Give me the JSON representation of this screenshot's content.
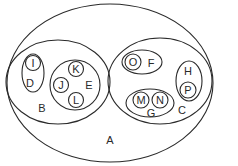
{
  "diagram": {
    "type": "nested-sets (Venn/Euler)",
    "stroke_color": "#2a2a2a",
    "background": "#ffffff",
    "sets": {
      "A": {
        "label": "A",
        "contains": [
          "B",
          "C"
        ]
      },
      "B": {
        "label": "B",
        "contains": [
          "D",
          "E"
        ]
      },
      "C": {
        "label": "C",
        "contains": [
          "F",
          "G",
          "H"
        ]
      },
      "D": {
        "label": "D",
        "contains": [
          "I"
        ]
      },
      "E": {
        "label": "E",
        "contains": [
          "J",
          "K",
          "L"
        ]
      },
      "F": {
        "label": "F",
        "contains": [
          "O"
        ]
      },
      "G": {
        "label": "G",
        "contains": [
          "M",
          "N"
        ]
      },
      "H": {
        "label": "H",
        "contains": [
          "P"
        ]
      },
      "I": {
        "label": "I"
      },
      "J": {
        "label": "J"
      },
      "K": {
        "label": "K"
      },
      "L": {
        "label": "L"
      },
      "M": {
        "label": "M"
      },
      "N": {
        "label": "N"
      },
      "O": {
        "label": "O"
      },
      "P": {
        "label": "P"
      }
    }
  }
}
